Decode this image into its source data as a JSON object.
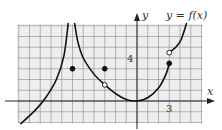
{
  "chart_data": {
    "type": "line",
    "title": "y = f(x)",
    "xlabel": "x",
    "ylabel": "y",
    "xlim": [
      -11,
      6
    ],
    "ylim": [
      -2,
      7
    ],
    "grid": true,
    "grid_step": 1,
    "tick_labels": [
      {
        "axis": "x",
        "value": 3,
        "label": "3"
      },
      {
        "axis": "y",
        "value": 4,
        "label": "4"
      }
    ],
    "vertical_asymptote": -6,
    "series": [
      {
        "name": "branch-left-of-asymptote",
        "description": "increasing curve rising to +infinity as x -> -6 from left",
        "points": [
          [
            -10.8,
            -2.1
          ],
          [
            -9.5,
            -0.9
          ],
          [
            -8.5,
            0.3
          ],
          [
            -7.5,
            2.0
          ],
          [
            -6.8,
            4.2
          ],
          [
            -6.4,
            7.2
          ]
        ]
      },
      {
        "name": "branch-right-of-asymptote",
        "description": "decreasing from +infinity near x=-6 to open point at (-3, 1.5)",
        "points": [
          [
            -5.8,
            7.2
          ],
          [
            -5.5,
            5.5
          ],
          [
            -5.0,
            4.0
          ],
          [
            -4.0,
            2.5
          ],
          [
            -3.0,
            1.5
          ]
        ]
      },
      {
        "name": "branch-middle",
        "description": "from open point (-3,1.5) down to minimum at (0,0) then up to closed point (3,3.5)",
        "points": [
          [
            -3.0,
            1.5
          ],
          [
            -2.0,
            0.7
          ],
          [
            -1.0,
            0.15
          ],
          [
            0.0,
            0.0
          ],
          [
            1.0,
            0.3
          ],
          [
            2.0,
            1.2
          ],
          [
            2.7,
            2.5
          ],
          [
            3.0,
            3.5
          ]
        ]
      },
      {
        "name": "branch-right",
        "description": "from open point (3,4.5) increasing upward",
        "points": [
          [
            3.0,
            4.5
          ],
          [
            3.6,
            5.0
          ],
          [
            4.1,
            5.7
          ],
          [
            4.6,
            7.2
          ]
        ]
      }
    ],
    "points": [
      {
        "x": -6,
        "y": 3,
        "style": "filled"
      },
      {
        "x": -3,
        "y": 3,
        "style": "filled"
      },
      {
        "x": -3,
        "y": 1.5,
        "style": "open"
      },
      {
        "x": 3,
        "y": 3.5,
        "style": "filled"
      },
      {
        "x": 3,
        "y": 4.5,
        "style": "open"
      }
    ],
    "annotations": [
      {
        "text": "y = f(x)",
        "position": "top-right"
      }
    ]
  },
  "labels": {
    "function_label": "y = f(x)",
    "x_axis": "x",
    "y_axis": "y",
    "x_tick_3": "3",
    "y_tick_4": "4"
  }
}
